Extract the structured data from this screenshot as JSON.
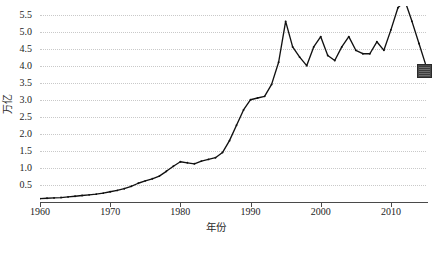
{
  "chart_data": {
    "type": "line",
    "title": "",
    "xlabel": "年份",
    "ylabel": "万亿",
    "xlim": [
      1960,
      2015
    ],
    "ylim": [
      0.0,
      5.75
    ],
    "grid": true,
    "legend_position": "none",
    "xticks": [
      1960,
      1970,
      1980,
      1990,
      2000,
      2010
    ],
    "xticklabels": [
      "1960",
      "1970",
      "1980",
      "1990",
      "2000",
      "2010"
    ],
    "yticks": [
      0.5,
      1.0,
      1.5,
      2.0,
      2.5,
      3.0,
      3.5,
      4.0,
      4.5,
      5.0,
      5.5
    ],
    "yticklabels": [
      "0.5",
      "1.0",
      "1.5",
      "2.0",
      "2.5",
      "3.0",
      "3.5",
      "4.0",
      "4.5",
      "5.0",
      "5.5"
    ],
    "series": [
      {
        "name": "总量",
        "color": "#111111",
        "marker": "dot",
        "x": [
          1960,
          1961,
          1962,
          1963,
          1964,
          1965,
          1966,
          1967,
          1968,
          1969,
          1970,
          1971,
          1972,
          1973,
          1974,
          1975,
          1976,
          1977,
          1978,
          1979,
          1980,
          1981,
          1982,
          1983,
          1984,
          1985,
          1986,
          1987,
          1988,
          1989,
          1990,
          1991,
          1992,
          1993,
          1994,
          1995,
          1996,
          1997,
          1998,
          1999,
          2000,
          2001,
          2002,
          2003,
          2004,
          2005,
          2006,
          2007,
          2008,
          2009,
          2010,
          2011,
          2012,
          2013,
          2014,
          2015
        ],
        "values": [
          0.1,
          0.11,
          0.12,
          0.13,
          0.15,
          0.17,
          0.19,
          0.21,
          0.23,
          0.26,
          0.3,
          0.34,
          0.39,
          0.46,
          0.55,
          0.62,
          0.68,
          0.76,
          0.9,
          1.05,
          1.18,
          1.15,
          1.12,
          1.2,
          1.25,
          1.3,
          1.45,
          1.8,
          2.25,
          2.7,
          3.0,
          3.05,
          3.1,
          3.45,
          4.1,
          5.3,
          4.55,
          4.25,
          4.0,
          4.55,
          4.85,
          4.3,
          4.15,
          4.55,
          4.85,
          4.45,
          4.35,
          4.35,
          4.7,
          4.45,
          5.05,
          5.7,
          5.9,
          5.3,
          4.65,
          4.0
        ]
      }
    ],
    "annotations": [
      {
        "name": "end-value-marker",
        "x": 2015,
        "y": 4.0,
        "shape": "square",
        "color": "#4a4a4a"
      }
    ]
  },
  "caption": {
    "text": ""
  }
}
